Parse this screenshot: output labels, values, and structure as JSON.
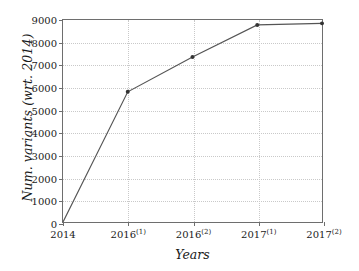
{
  "chart_data": {
    "type": "line",
    "title": "",
    "xlabel": "Years",
    "ylabel": "Num. variants (wrt. 2014)",
    "categories": [
      "2014",
      "2016(1)",
      "2016(2)",
      "2017(1)",
      "2017(2)"
    ],
    "category_labels_html": [
      "2014",
      "2016<sup>(1)</sup>",
      "2016<sup>(2)</sup>",
      "2017<sup>(1)</sup>",
      "2017<sup>(2)</sup>"
    ],
    "values": [
      0,
      5800,
      7350,
      8780,
      8850
    ],
    "series": [
      {
        "name": "Num. variants",
        "values": [
          0,
          5800,
          7350,
          8780,
          8850
        ]
      }
    ],
    "ylim": [
      0,
      9000
    ],
    "ytick_values": [
      0,
      1000,
      2000,
      3000,
      4000,
      5000,
      6000,
      7000,
      8000,
      9000
    ],
    "ytick_labels": [
      "0",
      "1000",
      "2000",
      "3000",
      "4000",
      "5000",
      "6000",
      "7000",
      "8000",
      "9000"
    ],
    "grid": true,
    "grid_style": "dotted",
    "legend": "none",
    "marker": "dot",
    "line_color": "#555555",
    "marker_color": "#333333",
    "grid_color": "#c9c9c9",
    "frame_color": "#6e6e6e",
    "background_color": "#ffffff"
  }
}
